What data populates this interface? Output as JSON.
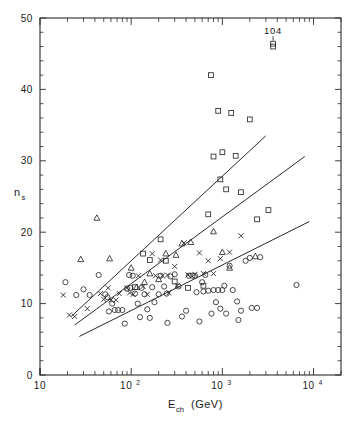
{
  "figure": {
    "annotation_label": "104",
    "yaxis": {
      "label_main": "n",
      "label_sub": "s",
      "ticks": [
        "0",
        "10",
        "20",
        "30",
        "40",
        "50"
      ]
    },
    "xaxis": {
      "label_main": "E",
      "label_sub": "ch",
      "label_unit": "(GeV)",
      "ticks": [
        "10",
        "10",
        "10",
        "10"
      ],
      "tick_exponents": [
        "",
        "2",
        "3",
        "4"
      ]
    },
    "colors": {
      "ink": "#2b2b2b",
      "background": "#ffffff"
    }
  },
  "chart_data": {
    "type": "scatter",
    "title": "",
    "xlabel": "E_ch (GeV)",
    "ylabel": "n_s",
    "xscale": "log",
    "yscale": "linear",
    "xlim": [
      10,
      20000
    ],
    "ylim": [
      0,
      50
    ],
    "grid": false,
    "legend": "none",
    "xticks": [
      10,
      100,
      1000,
      10000
    ],
    "xticklabels": [
      "10",
      "10^2",
      "10^3",
      "10^4"
    ],
    "yticks": [
      0,
      10,
      20,
      30,
      40,
      50
    ],
    "yticklabels": [
      "0",
      "10",
      "20",
      "30",
      "40",
      "50"
    ],
    "annotations": [
      {
        "text": "104",
        "x": 3600,
        "y": 46.4
      }
    ],
    "series": [
      {
        "name": "circles",
        "marker": "circle",
        "points": [
          [
            19,
            13.0
          ],
          [
            25,
            11.2
          ],
          [
            30,
            12.0
          ],
          [
            35,
            11.2
          ],
          [
            44,
            14.0
          ],
          [
            52,
            11.3
          ],
          [
            55,
            10.9
          ],
          [
            57,
            8.9
          ],
          [
            62,
            10.0
          ],
          [
            66,
            9.1
          ],
          [
            72,
            9.1
          ],
          [
            80,
            9.1
          ],
          [
            85,
            7.2
          ],
          [
            90,
            12.1
          ],
          [
            95,
            14.0
          ],
          [
            98,
            12.2
          ],
          [
            104,
            13.9
          ],
          [
            110,
            11.4
          ],
          [
            118,
            10.0
          ],
          [
            125,
            8.1
          ],
          [
            130,
            12.2
          ],
          [
            140,
            11.3
          ],
          [
            150,
            9.2
          ],
          [
            160,
            8.0
          ],
          [
            170,
            12.3
          ],
          [
            180,
            10.2
          ],
          [
            200,
            11.3
          ],
          [
            210,
            13.9
          ],
          [
            230,
            12.4
          ],
          [
            245,
            11.4
          ],
          [
            250,
            7.3
          ],
          [
            270,
            13.8
          ],
          [
            300,
            14.1
          ],
          [
            330,
            12.4
          ],
          [
            360,
            8.2
          ],
          [
            400,
            9.0
          ],
          [
            430,
            13.9
          ],
          [
            470,
            13.9
          ],
          [
            500,
            13.9
          ],
          [
            520,
            11.6
          ],
          [
            560,
            7.5
          ],
          [
            600,
            13.0
          ],
          [
            620,
            11.7
          ],
          [
            650,
            14.0
          ],
          [
            700,
            11.8
          ],
          [
            760,
            8.6
          ],
          [
            800,
            11.9
          ],
          [
            850,
            10.2
          ],
          [
            900,
            11.9
          ],
          [
            950,
            9.3
          ],
          [
            1000,
            11.9
          ],
          [
            1050,
            12.5
          ],
          [
            1100,
            8.6
          ],
          [
            1200,
            15.3
          ],
          [
            1300,
            11.9
          ],
          [
            1450,
            10.3
          ],
          [
            1500,
            7.7
          ],
          [
            1600,
            9.0
          ],
          [
            1800,
            16.0
          ],
          [
            2000,
            16.4
          ],
          [
            2100,
            9.4
          ],
          [
            2400,
            9.4
          ],
          [
            2600,
            16.5
          ],
          [
            6500,
            12.6
          ]
        ]
      },
      {
        "name": "triangles",
        "marker": "triangle",
        "points": [
          [
            28,
            16.2
          ],
          [
            42,
            22.0
          ],
          [
            58,
            16.3
          ],
          [
            100,
            15.0
          ],
          [
            115,
            12.3
          ],
          [
            140,
            13.0
          ],
          [
            160,
            14.2
          ],
          [
            200,
            13.4
          ],
          [
            240,
            17.0
          ],
          [
            310,
            16.8
          ],
          [
            360,
            18.4
          ],
          [
            450,
            18.6
          ],
          [
            800,
            20.1
          ],
          [
            1000,
            17.2
          ],
          [
            1200,
            15.0
          ],
          [
            2300,
            16.6
          ]
        ]
      },
      {
        "name": "squares",
        "marker": "square",
        "points": [
          [
            110,
            12.3
          ],
          [
            135,
            17.0
          ],
          [
            160,
            16.1
          ],
          [
            210,
            19.0
          ],
          [
            240,
            16.0
          ],
          [
            300,
            13.1
          ],
          [
            420,
            12.2
          ],
          [
            620,
            12.5
          ],
          [
            700,
            22.5
          ],
          [
            750,
            42.0
          ],
          [
            800,
            30.6
          ],
          [
            900,
            37.0
          ],
          [
            950,
            27.4
          ],
          [
            1000,
            31.2
          ],
          [
            1100,
            26.0
          ],
          [
            1250,
            36.7
          ],
          [
            1400,
            30.7
          ],
          [
            1600,
            25.6
          ],
          [
            2000,
            35.8
          ],
          [
            2400,
            21.8
          ],
          [
            3200,
            23.1
          ],
          [
            3600,
            46.0
          ]
        ]
      },
      {
        "name": "crosses",
        "marker": "cross",
        "points": [
          [
            18,
            11.2
          ],
          [
            21,
            8.4
          ],
          [
            24,
            8.2
          ],
          [
            33,
            9.3
          ],
          [
            46,
            11.4
          ],
          [
            50,
            10.6
          ],
          [
            56,
            12.2
          ],
          [
            60,
            10.5
          ],
          [
            68,
            10.5
          ],
          [
            74,
            11.4
          ],
          [
            90,
            12.2
          ],
          [
            96,
            11.5
          ],
          [
            105,
            11.3
          ],
          [
            120,
            13.9
          ],
          [
            135,
            12.4
          ],
          [
            150,
            11.3
          ],
          [
            170,
            17.0
          ],
          [
            185,
            13.9
          ],
          [
            210,
            16.1
          ],
          [
            220,
            13.9
          ],
          [
            250,
            14.0
          ],
          [
            260,
            11.5
          ],
          [
            300,
            15.2
          ],
          [
            320,
            12.5
          ],
          [
            380,
            18.5
          ],
          [
            420,
            14.0
          ],
          [
            500,
            14.1
          ],
          [
            560,
            17.1
          ],
          [
            620,
            14.2
          ],
          [
            700,
            16.0
          ],
          [
            800,
            14.2
          ],
          [
            950,
            16.3
          ],
          [
            1200,
            17.2
          ],
          [
            1600,
            19.5
          ]
        ]
      }
    ],
    "fit_lines": [
      {
        "name": "upper-line",
        "x1": 22,
        "y1": 8.2,
        "x2": 3000,
        "y2": 33.5
      },
      {
        "name": "middle-line",
        "x1": 24,
        "y1": 7.0,
        "x2": 8000,
        "y2": 30.6
      },
      {
        "name": "lower-line",
        "x1": 27,
        "y1": 5.4,
        "x2": 9000,
        "y2": 21.5
      }
    ]
  }
}
